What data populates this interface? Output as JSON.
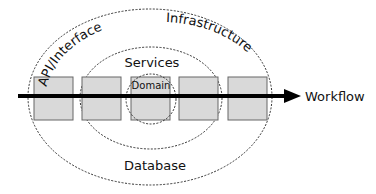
{
  "diagram": {
    "layers": [
      {
        "id": "infrastructure",
        "label": "Infrastructure"
      },
      {
        "id": "api",
        "label": "API/Interface"
      },
      {
        "id": "services",
        "label": "Services"
      },
      {
        "id": "domain",
        "label": "Domain"
      },
      {
        "id": "database",
        "label": "Database"
      }
    ],
    "arrow": {
      "label": "Workflow"
    },
    "boxes": [
      {
        "id": "box-1"
      },
      {
        "id": "box-2"
      },
      {
        "id": "box-3"
      },
      {
        "id": "box-4"
      },
      {
        "id": "box-5"
      }
    ],
    "colors": {
      "box_fill": "#d9d9d9",
      "box_stroke": "#666666",
      "ellipse_stroke": "#333333",
      "arrow": "#000000",
      "text": "#111111"
    }
  }
}
